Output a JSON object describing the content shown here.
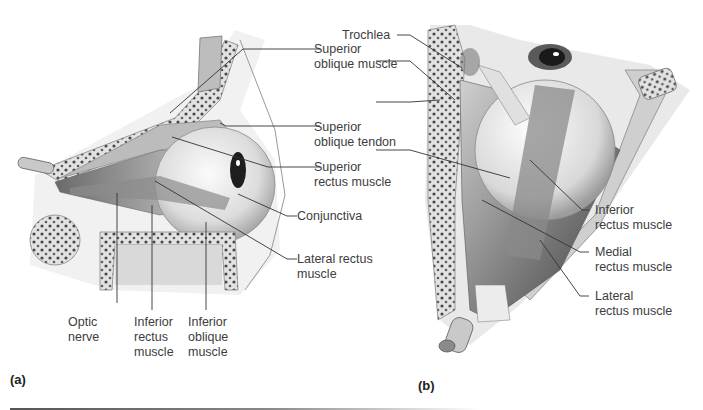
{
  "figure": {
    "panels": [
      {
        "id": "a",
        "letter": "(a)",
        "view": "lateral view of right eye extrinsic muscles",
        "labels": {
          "superior_oblique_muscle": [
            "Superior",
            "oblique muscle"
          ],
          "superior_oblique_tendon": [
            "Superior",
            "oblique tendon"
          ],
          "superior_rectus_muscle": [
            "Superior",
            "rectus muscle"
          ],
          "conjunctiva": [
            "Conjunctiva"
          ],
          "lateral_rectus_muscle": [
            "Lateral rectus",
            "muscle"
          ],
          "optic_nerve": [
            "Optic",
            "nerve"
          ],
          "inferior_rectus_muscle": [
            "Inferior",
            "rectus",
            "muscle"
          ],
          "inferior_oblique_muscle": [
            "Inferior",
            "oblique",
            "muscle"
          ]
        }
      },
      {
        "id": "b",
        "letter": "(b)",
        "view": "superior view of orbit",
        "labels": {
          "trochlea": [
            "Trochlea"
          ],
          "inferior_rectus_muscle": [
            "Inferior",
            "rectus muscle"
          ],
          "medial_rectus_muscle": [
            "Medial",
            "rectus muscle"
          ],
          "lateral_rectus_muscle": [
            "Lateral",
            "rectus muscle"
          ]
        }
      }
    ],
    "colors": {
      "label_text": "#3d3d3d",
      "leader_line": "#333333",
      "tissue_light": "#e6e6e6",
      "tissue_mid": "#9a9a9a",
      "tissue_dark": "#444444"
    }
  }
}
